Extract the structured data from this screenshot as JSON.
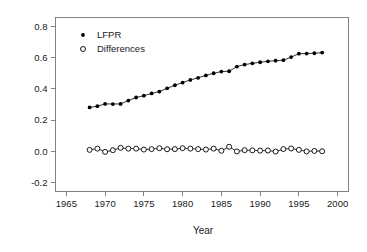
{
  "chart_data": {
    "type": "line",
    "title": "",
    "xlabel": "Year",
    "ylabel": "",
    "xlim": [
      1963.6,
      2001.4
    ],
    "ylim": [
      -0.26,
      0.86
    ],
    "xticks": [
      1965,
      1970,
      1975,
      1980,
      1985,
      1990,
      1995,
      2000
    ],
    "xtick_labels": [
      "1965",
      "1970",
      "1975",
      "1980",
      "1985",
      "1990",
      "1995",
      "2000"
    ],
    "yticks": [
      -0.2,
      0.0,
      0.2,
      0.4,
      0.6,
      0.8
    ],
    "ytick_labels": [
      "-0.2",
      "0.0",
      "0.2",
      "0.4",
      "0.6",
      "0.8"
    ],
    "grid": false,
    "legend_position": "top-left",
    "x": [
      1968,
      1969,
      1970,
      1971,
      1972,
      1973,
      1974,
      1975,
      1976,
      1977,
      1978,
      1979,
      1980,
      1981,
      1982,
      1983,
      1984,
      1985,
      1986,
      1987,
      1988,
      1989,
      1990,
      1991,
      1992,
      1993,
      1994,
      1995,
      1996,
      1997,
      1998
    ],
    "series": [
      {
        "name": "LFPR",
        "marker": "filled-circle",
        "values": [
          0.281,
          0.289,
          0.304,
          0.303,
          0.304,
          0.325,
          0.345,
          0.357,
          0.371,
          0.383,
          0.404,
          0.424,
          0.441,
          0.458,
          0.472,
          0.487,
          0.501,
          0.512,
          0.514,
          0.544,
          0.557,
          0.565,
          0.572,
          0.578,
          0.582,
          0.585,
          0.605,
          0.627,
          0.628,
          0.63,
          0.634
        ]
      },
      {
        "name": "Differences",
        "marker": "open-circle",
        "values": [
          0.008,
          0.016,
          -0.005,
          0.006,
          0.021,
          0.016,
          0.016,
          0.01,
          0.013,
          0.019,
          0.012,
          0.013,
          0.019,
          0.016,
          0.013,
          0.01,
          0.016,
          0.002,
          0.028,
          -0.002,
          0.006,
          0.005,
          0.003,
          0.004,
          -0.003,
          0.013,
          0.017,
          0.008,
          -0.002,
          0.001,
          -0.001
        ]
      }
    ]
  },
  "legend": {
    "entries": [
      {
        "label": "LFPR",
        "marker": "filled-circle"
      },
      {
        "label": "Differences",
        "marker": "open-circle"
      }
    ]
  },
  "axes": {
    "x_title": "Year"
  }
}
